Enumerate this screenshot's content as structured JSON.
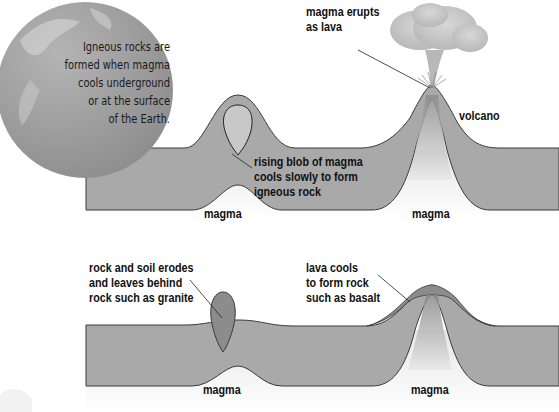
{
  "globe": {
    "text": "Igneous rocks are\nformed when magma\ncools underground\nor at the surface\nof the Earth."
  },
  "top_diagram": {
    "labels": {
      "eruption": "magma erupts\nas lava",
      "volcano": "volcano",
      "blob": "rising blob of magma\ncools slowly to form\nigneous rock",
      "magma_left": "magma",
      "magma_right": "magma"
    }
  },
  "bottom_diagram": {
    "labels": {
      "granite": "rock and soil erodes\nand leaves behind\nrock such as granite",
      "basalt": "lava cools\nto form rock\nsuch as basalt",
      "magma_left": "magma",
      "magma_right": "magma"
    }
  },
  "colors": {
    "crust": "#a9a9a9",
    "crust_outline": "#3a3a3a",
    "rock_dark": "#8c8c8c",
    "magma_bg": "#f2f2f2",
    "globe": "#9a9a9a"
  }
}
